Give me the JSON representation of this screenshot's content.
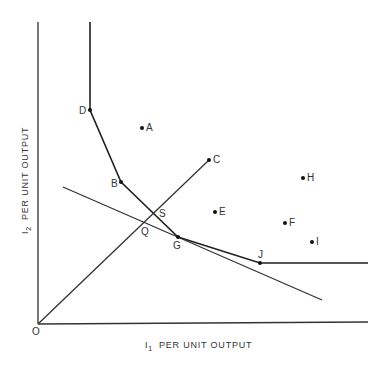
{
  "diagram": {
    "x_axis_label": {
      "var": "I",
      "sub": "1",
      "text": "PER UNIT OUTPUT"
    },
    "y_axis_label": {
      "var": "I",
      "sub": "2",
      "text": "PER UNIT OUTPUT"
    },
    "origin_label": "O",
    "points": [
      {
        "label": "D",
        "x": 90,
        "y": 110,
        "lx": 79,
        "ly": 114
      },
      {
        "label": "A",
        "x": 142,
        "y": 128,
        "lx": 146,
        "ly": 131
      },
      {
        "label": "B",
        "x": 121,
        "y": 182,
        "lx": 111,
        "ly": 187
      },
      {
        "label": "C",
        "x": 209,
        "y": 160,
        "lx": 213,
        "ly": 163
      },
      {
        "label": "H",
        "x": 303,
        "y": 178,
        "lx": 307,
        "ly": 181
      },
      {
        "label": "E",
        "x": 215,
        "y": 212,
        "lx": 219,
        "ly": 215
      },
      {
        "label": "F",
        "x": 285,
        "y": 223,
        "lx": 289,
        "ly": 226
      },
      {
        "label": "I",
        "x": 312,
        "y": 242,
        "lx": 316,
        "ly": 245
      },
      {
        "label": "G",
        "x": 178,
        "y": 237,
        "lx": 173,
        "ly": 249
      },
      {
        "label": "J",
        "x": 260,
        "y": 263,
        "lx": 258,
        "ly": 258
      }
    ],
    "intersections": [
      {
        "label": "S",
        "lx": 159,
        "ly": 217
      },
      {
        "label": "Q",
        "lx": 141,
        "ly": 235
      }
    ],
    "isoquant_label": "Isoquant D-B-G-J",
    "ray_label": "Ray O-C",
    "price_line_label": "Isocost line"
  }
}
